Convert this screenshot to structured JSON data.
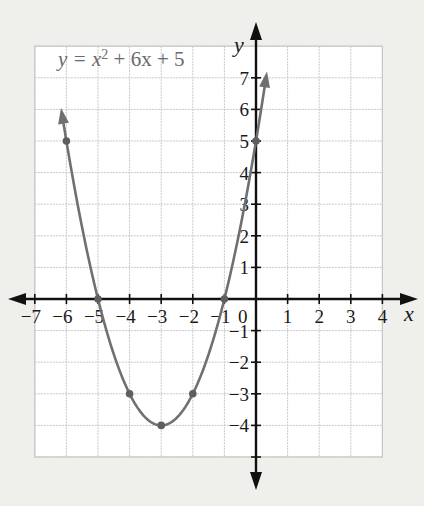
{
  "chart_data": {
    "type": "line",
    "equation": {
      "prefix": "y = x",
      "exponent": "2",
      "suffix": " + 6x + 5"
    },
    "xlabel": "x",
    "ylabel": "y",
    "xlim": [
      -7,
      4
    ],
    "ylim": [
      -5,
      8
    ],
    "grid": true,
    "x_ticks": [
      -7,
      -6,
      -5,
      -4,
      -3,
      -2,
      -1,
      1,
      2,
      3,
      4
    ],
    "y_ticks": [
      -4,
      -3,
      -2,
      -1,
      1,
      2,
      3,
      4,
      5,
      6,
      7
    ],
    "x_tick_labels": [
      "−7",
      "−6",
      "−5",
      "−4",
      "−3",
      "−2",
      "−1",
      "1",
      "2",
      "3",
      "4"
    ],
    "y_tick_labels": [
      "−4",
      "−3",
      "−2",
      "−1",
      "1",
      "2",
      "3",
      "4",
      "5",
      "6",
      "7"
    ],
    "origin_label": "0",
    "series": [
      {
        "name": "y = x^2 + 6x + 5",
        "function": "x^2 + 6x + 5",
        "domain_drawn": [
          -6.12,
          0.3
        ],
        "marked_points": [
          {
            "x": -6,
            "y": 5
          },
          {
            "x": -5,
            "y": 0
          },
          {
            "x": -4,
            "y": -3
          },
          {
            "x": -3,
            "y": -4
          },
          {
            "x": -2,
            "y": -3
          },
          {
            "x": -1,
            "y": 0
          },
          {
            "x": 0,
            "y": 5
          }
        ],
        "arrows_on_ends": true
      }
    ],
    "vertex": {
      "x": -3,
      "y": -4
    },
    "roots": [
      -5,
      -1
    ],
    "y_intercept": 5
  },
  "colors": {
    "background": "#efefec",
    "grid_bg": "#ffffff",
    "grid_line": "#c8c8c8",
    "axis": "#111111",
    "curve": "#707070",
    "point": "#5e5e5e",
    "equation_text": "#6a6a6a"
  },
  "layout": {
    "origin_px": [
      256,
      299
    ],
    "unit_px": 31.6
  }
}
